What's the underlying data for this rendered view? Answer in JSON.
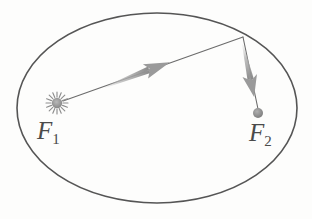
{
  "figure": {
    "kind": "orbital-ellipse-diagram",
    "width": 312,
    "height": 219,
    "background_color": "#fdfdfc"
  },
  "ellipse": {
    "name": "orbit-ellipse",
    "center_x": 157,
    "center_y": 108,
    "radius_x": 140,
    "radius_y": 95,
    "stroke_color": "#555555",
    "stroke_width": 1.6,
    "fill": "none"
  },
  "foci": [
    {
      "id": "f1",
      "label": "F",
      "subscript": "1",
      "marker": "sun-icon",
      "marker_type": "star-burst",
      "x": 57,
      "y": 103,
      "core_radius": 5,
      "ray_length": 11,
      "color": "#8e8e8e",
      "label_x": 37,
      "label_y": 118
    },
    {
      "id": "f2",
      "label": "F",
      "subscript": "2",
      "marker": "empty-focus-dot-icon",
      "marker_type": "filled-circle",
      "x": 258,
      "y": 113,
      "core_radius": 5,
      "color": "#8e8e8e",
      "label_x": 249,
      "label_y": 120
    }
  ],
  "radius_line": {
    "name": "focal-radius-line",
    "from_x": 63,
    "from_y": 101,
    "to_x": 243,
    "to_y": 37,
    "stroke_color": "#6b6b6b",
    "stroke_width": 1.1
  },
  "focus2_line": {
    "name": "second-focal-radius-line",
    "from_x": 243,
    "from_y": 37,
    "to_x": 258,
    "to_y": 109,
    "stroke_color": "#6b6b6b",
    "stroke_width": 1.1
  },
  "arrows": [
    {
      "id": "arrow-outbound",
      "name": "outbound-radius-arrow",
      "tail_x": 104,
      "tail_y": 86,
      "tip_x": 170,
      "tip_y": 62,
      "color": "#9a9a9a",
      "thickness": 7
    },
    {
      "id": "arrow-inbound",
      "name": "inbound-radius-arrow",
      "tail_x": 244,
      "tail_y": 44,
      "tip_x": 254,
      "tip_y": 96,
      "color": "#9a9a9a",
      "thickness": 7
    }
  ],
  "colors": {
    "ellipse_stroke": "#555555",
    "line_stroke": "#6b6b6b",
    "arrow_fill": "#9a9a9a",
    "marker_fill": "#8e8e8e",
    "label_text": "#4a4a4a",
    "background": "#fdfdfc"
  }
}
